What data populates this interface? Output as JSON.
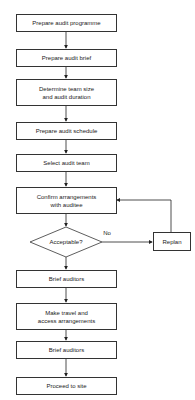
{
  "diagram": {
    "type": "flowchart",
    "nodes": [
      {
        "id": "n1",
        "label": "Prepare audit programme",
        "shape": "rect"
      },
      {
        "id": "n2",
        "label": "Prepare audit brief",
        "shape": "rect"
      },
      {
        "id": "n3",
        "label": "Determine team size\nand audit duration",
        "shape": "rect"
      },
      {
        "id": "n4",
        "label": "Prepare audit schedule",
        "shape": "rect"
      },
      {
        "id": "n5",
        "label": "Select audit team",
        "shape": "rect"
      },
      {
        "id": "n6",
        "label": "Confirm arrangements\nwith auditee",
        "shape": "rect"
      },
      {
        "id": "d1",
        "label": "Acceptable?",
        "shape": "diamond"
      },
      {
        "id": "r1",
        "label": "Replan",
        "shape": "rect"
      },
      {
        "id": "n7",
        "label": "Brief auditors",
        "shape": "rect"
      },
      {
        "id": "n8",
        "label": "Make travel and\naccess arrangements",
        "shape": "rect"
      },
      {
        "id": "n9",
        "label": "Brief auditors",
        "shape": "rect"
      },
      {
        "id": "n10",
        "label": "Proceed to site",
        "shape": "rect"
      }
    ],
    "edges": [
      {
        "from": "n1",
        "to": "n2"
      },
      {
        "from": "n2",
        "to": "n3"
      },
      {
        "from": "n3",
        "to": "n4"
      },
      {
        "from": "n4",
        "to": "n5"
      },
      {
        "from": "n5",
        "to": "n6"
      },
      {
        "from": "n6",
        "to": "d1"
      },
      {
        "from": "d1",
        "to": "r1",
        "label": "No"
      },
      {
        "from": "r1",
        "to": "n6"
      },
      {
        "from": "d1",
        "to": "n7"
      },
      {
        "from": "n7",
        "to": "n8"
      },
      {
        "from": "n8",
        "to": "n9"
      },
      {
        "from": "n9",
        "to": "n10"
      }
    ],
    "edge_labels": {
      "no": "No"
    }
  }
}
